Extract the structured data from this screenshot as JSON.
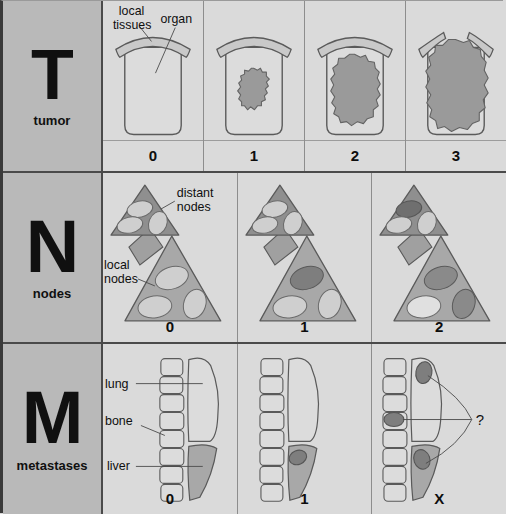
{
  "figure": {
    "background_color": "#d9d9d9",
    "label_column_color": "#b9b9b9",
    "panel_color": "#dadada"
  },
  "colors": {
    "outline": "#5a5a5a",
    "tumor_fill": "#9a9a9a",
    "organ_fill": "#dcdcdc",
    "tissue_fill": "#c9c9c9",
    "distant_node_triangle": "#8f8f8f",
    "local_node_triangle": "#a8a8a8",
    "node_clear": "#cfcfcf",
    "node_involved": "#7e7e7e",
    "liver_fill": "#a8a8a8",
    "lung_fill": "#dcdcdc",
    "bone_fill": "#dcdcdc",
    "lesion_fill": "#7e7e7e",
    "text": "#0f0f0f"
  },
  "rows": [
    {
      "key": "T",
      "letter": "T",
      "name": "tumor",
      "annotations": [
        "local tissues",
        "organ"
      ],
      "labels": {
        "local_tissues_line1": "local",
        "local_tissues_line2": "tissues",
        "organ": "organ"
      },
      "panels": [
        {
          "stage": "0",
          "description": "no tumor present in organ"
        },
        {
          "stage": "1",
          "description": "small tumor confined within organ"
        },
        {
          "stage": "2",
          "description": "larger tumor still confined within organ"
        },
        {
          "stage": "3",
          "description": "large tumor breaching organ wall into local tissues"
        }
      ]
    },
    {
      "key": "N",
      "letter": "N",
      "name": "nodes",
      "annotations": [
        "distant nodes",
        "local nodes"
      ],
      "labels": {
        "distant_nodes_line1": "distant",
        "distant_nodes_line2": "nodes",
        "local_nodes_line1": "local",
        "local_nodes_line2": "nodes"
      },
      "panels": [
        {
          "stage": "0",
          "description": "no nodes involved",
          "involved_local": 0,
          "involved_distant": 0
        },
        {
          "stage": "1",
          "description": "one local node involved",
          "involved_local": 1,
          "involved_distant": 0
        },
        {
          "stage": "2",
          "description": "multiple local nodes and a distant node involved",
          "involved_local": 2,
          "involved_distant": 1
        }
      ]
    },
    {
      "key": "M",
      "letter": "M",
      "name": "metastases",
      "annotations": [
        "lung",
        "bone",
        "liver"
      ],
      "labels": {
        "lung": "lung",
        "bone": "bone",
        "liver": "liver",
        "question": "?"
      },
      "panels": [
        {
          "stage": "0",
          "description": "no distant metastases",
          "lesions": []
        },
        {
          "stage": "1",
          "description": "metastasis present in liver",
          "lesions": [
            "liver"
          ]
        },
        {
          "stage": "X",
          "description": "metastases cannot be assessed",
          "lesions": [
            "lung",
            "bone",
            "liver"
          ]
        }
      ]
    }
  ]
}
